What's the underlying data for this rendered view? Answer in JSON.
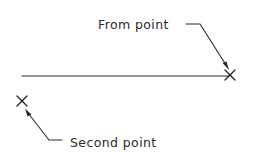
{
  "diagram": {
    "type": "cad-line-command-illustration",
    "labels": {
      "from_point": "From point",
      "second_point": "Second point"
    },
    "elements": [
      {
        "kind": "line",
        "description": "drawn line segment ending at the from point"
      },
      {
        "kind": "point-marker",
        "glyph": "x-mark",
        "label_ref": "from_point"
      },
      {
        "kind": "point-marker",
        "glyph": "x-mark",
        "label_ref": "second_point"
      }
    ],
    "colors": {
      "ink": "#2a2a2a",
      "background": "#ffffff"
    }
  }
}
